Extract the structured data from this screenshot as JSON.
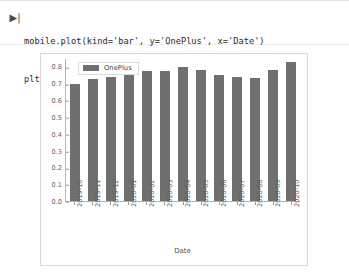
{
  "notebook": {
    "run_marker": "▶|",
    "code_lines": [
      "mobile.plot(kind='bar', y='OnePlus', x='Date')",
      "plt.show()"
    ]
  },
  "chart_data": {
    "type": "bar",
    "title": "",
    "xlabel": "Date",
    "ylabel": "",
    "categories": [
      "2019-10",
      "2019-11",
      "2019-12",
      "2020-01",
      "2020-02",
      "2020-03",
      "2020-04",
      "2020-05",
      "2020-06",
      "2020-07",
      "2020-08",
      "2020-09",
      "2020-10"
    ],
    "series": [
      {
        "name": "OnePlus",
        "color": "#6f6f6f",
        "values": [
          0.7,
          0.73,
          0.74,
          0.795,
          0.78,
          0.78,
          0.8,
          0.785,
          0.755,
          0.745,
          0.735,
          0.785,
          0.835
        ]
      }
    ],
    "ylim": [
      0.0,
      0.85
    ],
    "y_ticks": [
      "0.0",
      "0.1",
      "0.2",
      "0.3",
      "0.4",
      "0.5",
      "0.6",
      "0.7",
      "0.8"
    ],
    "y_tick_values": [
      0.0,
      0.1,
      0.2,
      0.3,
      0.4,
      0.5,
      0.6,
      0.7,
      0.8
    ],
    "grid": false,
    "legend": {
      "position": "upper-left",
      "entries": [
        "OnePlus"
      ]
    }
  }
}
